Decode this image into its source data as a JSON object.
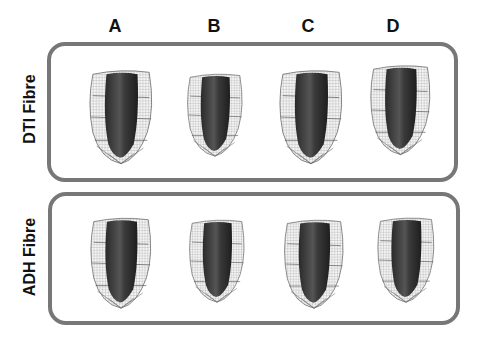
{
  "columns": [
    {
      "label": "A"
    },
    {
      "label": "B"
    },
    {
      "label": "C"
    },
    {
      "label": "D"
    }
  ],
  "rows": [
    {
      "label": "DTI  Fibre"
    },
    {
      "label": "ADH  Fibre"
    }
  ],
  "colors": {
    "panel_border": "#777777",
    "mesh": "#888888",
    "fibre_dark": "#2e2e2e",
    "fibre_mid": "#6a6a6a"
  }
}
